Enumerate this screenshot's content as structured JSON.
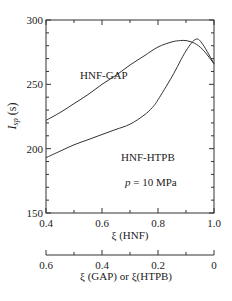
{
  "chart_data": {
    "type": "line",
    "title": "",
    "xlabel": "ξ (HNF)",
    "x2label": "ξ (GAP)  or  ξ(HTPB)",
    "ylabel": "I_sp (s)",
    "ylabel_main": "I",
    "ylabel_sub": "sp",
    "ylabel_unit": " (s)",
    "annotation": "p = 10 MPa",
    "annotation_var": "p",
    "annotation_rest": " = 10 MPa",
    "xlim": [
      0.4,
      1.0
    ],
    "ylim": [
      150,
      300
    ],
    "x2lim": [
      0.6,
      0
    ],
    "grid": false,
    "legend_position": "inline-labels",
    "yticks": [
      "150",
      "200",
      "250",
      "300"
    ],
    "xticks": [
      "0.4",
      "0.6",
      "0.8",
      "1.0"
    ],
    "x2ticks": [
      "0.6",
      "0.4",
      "0.2",
      "0"
    ],
    "series": [
      {
        "name": "HNF-GAP",
        "x": [
          0.4,
          0.45,
          0.5,
          0.55,
          0.6,
          0.65,
          0.7,
          0.75,
          0.8,
          0.85,
          0.88,
          0.9,
          0.93,
          0.96,
          1.0
        ],
        "y": [
          222,
          228,
          235,
          242,
          250,
          257,
          265,
          272,
          279,
          283,
          284,
          284,
          282,
          277,
          266
        ]
      },
      {
        "name": "HNF-HTPB",
        "x": [
          0.4,
          0.45,
          0.5,
          0.55,
          0.6,
          0.65,
          0.7,
          0.75,
          0.78,
          0.8,
          0.85,
          0.9,
          0.935,
          0.96,
          1.0
        ],
        "y": [
          193,
          198,
          203,
          207,
          211,
          215,
          219,
          226,
          232,
          238,
          256,
          276,
          285,
          281,
          266
        ]
      }
    ]
  }
}
